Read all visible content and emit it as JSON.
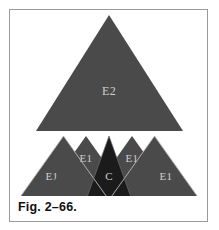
{
  "figure": {
    "caption": "Fig. 2–66.",
    "background_color": "#ffffff",
    "frame_color": "#9b9b9b",
    "fill_gray": "#4a4a4a",
    "fill_dark": "#1b1b1b",
    "divider_color": "#b9b9b9",
    "label_color": "#cfcfcf"
  },
  "diagram": {
    "type": "triangle-partition",
    "upper": {
      "label": "E2",
      "fill": "#4a4a4a",
      "apex": [
        109,
        15
      ],
      "base_left": [
        36,
        131
      ],
      "base_right": [
        183,
        131
      ]
    },
    "lower_row": [
      {
        "label": "E1",
        "fill": "#4a4a4a",
        "position": "outer-left"
      },
      {
        "label": "E1",
        "fill": "#4a4a4a",
        "position": "inner-left"
      },
      {
        "label": "C",
        "fill": "#1b1b1b",
        "position": "center-inverted"
      },
      {
        "label": "E1",
        "fill": "#4a4a4a",
        "position": "inner-right"
      },
      {
        "label": "E1",
        "fill": "#4a4a4a",
        "position": "outer-right"
      }
    ],
    "lower_bounds": {
      "left": 18,
      "right": 200,
      "top": 136,
      "bottom": 200
    }
  }
}
